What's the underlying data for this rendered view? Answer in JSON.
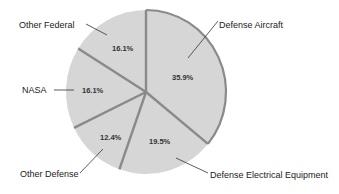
{
  "chart_data": {
    "type": "pie",
    "title": "",
    "start_angle": "top (12 o'clock), clockwise",
    "slices": [
      {
        "label": "Defense Aircraft",
        "value": 35.9,
        "value_label": "35.9%"
      },
      {
        "label": "Defense Electrical Equipment",
        "value": 19.5,
        "value_label": "19.5%"
      },
      {
        "label": "Other Defense",
        "value": 12.4,
        "value_label": "12.4%"
      },
      {
        "label": "NASA",
        "value": 16.1,
        "value_label": "16.1%"
      },
      {
        "label": "Other Federal",
        "value": 16.1,
        "value_label": "16.1%"
      }
    ],
    "legend": "none (labels with leader lines)",
    "colors": {
      "slice_fill": "#d6d6d6",
      "separator": "#8a8a8a",
      "highlight_outline": "#8a8a8a",
      "text": "#222222"
    }
  },
  "labels": {
    "defense_aircraft": "Defense Aircraft",
    "defense_electrical": "Defense Electrical Equipment",
    "other_defense": "Other Defense",
    "nasa": "NASA",
    "other_federal": "Other Federal"
  },
  "percents": {
    "defense_aircraft": "35.9%",
    "defense_electrical": "19.5%",
    "other_defense": "12.4%",
    "nasa": "16.1%",
    "other_federal": "16.1%"
  }
}
